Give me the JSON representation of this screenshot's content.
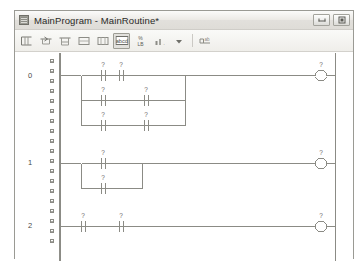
{
  "window": {
    "title": "MainProgram - MainRoutine*",
    "icon": "routine-icon",
    "buttons": {
      "minimize_label": "Minimize",
      "maximize_label": "Maximize"
    }
  },
  "toolbar": {
    "items": [
      {
        "name": "new-rung-button",
        "icon": "new-rung-icon",
        "label": "New Rung",
        "pressed": false
      },
      {
        "name": "new-branch-button",
        "icon": "new-branch-icon",
        "label": "New Branch",
        "pressed": false
      },
      {
        "name": "new-branch-level-button",
        "icon": "new-branch-level-icon",
        "label": "New Branch Level",
        "pressed": false
      },
      {
        "name": "append-to-rung-button",
        "icon": "append-rung-icon",
        "label": "Append to Rung",
        "pressed": false
      },
      {
        "name": "insert-in-branch-button",
        "icon": "insert-branch-icon",
        "label": "Insert in Branch",
        "pressed": false
      },
      {
        "name": "examine-on-button",
        "icon": "abcd-icon",
        "label": "abcd",
        "pressed": true
      },
      {
        "name": "output-energize-button",
        "icon": "coil-icon",
        "label": "Output Energize",
        "pressed": false
      },
      {
        "name": "timer-counter-button",
        "icon": "timer-icon",
        "label": "Timer/Counter",
        "pressed": false
      },
      {
        "name": "dropdown-button",
        "icon": "chevron-down-icon",
        "label": "More Instructions",
        "pressed": false
      },
      {
        "name": "favorites-button",
        "icon": "tab-icon",
        "label": "Favorites",
        "pressed": false
      }
    ]
  },
  "ladder": {
    "tag_placeholder": "?",
    "rail_color": "#8f8f89",
    "wire_color": "#8b8b85",
    "rungs": [
      {
        "number": "0",
        "layout": "parallel",
        "branches": [
          {
            "contacts": [
              "?",
              "?"
            ]
          },
          {
            "contacts": [
              "?",
              "?"
            ]
          },
          {
            "contacts": [
              "?",
              "?"
            ]
          }
        ],
        "output": {
          "type": "coil",
          "tag": "?"
        }
      },
      {
        "number": "1",
        "layout": "parallel",
        "branches": [
          {
            "contacts": [
              "?"
            ]
          },
          {
            "contacts": [
              "?"
            ]
          }
        ],
        "output": {
          "type": "coil",
          "tag": "?"
        }
      },
      {
        "number": "2",
        "layout": "series",
        "branches": [
          {
            "contacts": [
              "?",
              "?"
            ]
          }
        ],
        "output": {
          "type": "coil",
          "tag": "?"
        }
      }
    ]
  }
}
